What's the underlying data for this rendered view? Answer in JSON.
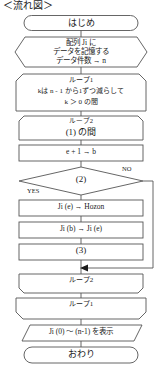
{
  "diagram": {
    "title": "＜流れ図＞",
    "type": "flowchart",
    "language": "ja",
    "colors": {
      "stroke": "#555555",
      "text": "#1a1a1a",
      "background": "#ffffff"
    }
  },
  "nodes": {
    "start": {
      "shape": "terminator",
      "text": "はじめ"
    },
    "prepare": {
      "shape": "hexagon",
      "line1": "配列 Ji に",
      "line2": "データを記憶する",
      "line3": "データ件数 → n"
    },
    "loop1_start": {
      "shape": "loop-start",
      "line1": "ループ1",
      "line2": "kは n - 1 から1ずつ減らして",
      "line3": "k ＞ 0 の間"
    },
    "loop2_start": {
      "shape": "loop-start",
      "line1": "ループ2",
      "line2": "(1) の間"
    },
    "process_b": {
      "shape": "process",
      "text": "e + 1 → b"
    },
    "decision": {
      "shape": "decision",
      "text": "(2)"
    },
    "proc_hozon": {
      "shape": "process",
      "text": "Ji (e)  →  Hozon"
    },
    "proc_jib": {
      "shape": "process",
      "text": "Ji (b)  →  Ji (e)"
    },
    "proc_blank3": {
      "shape": "process",
      "text": "(3)"
    },
    "loop2_end": {
      "shape": "loop-end",
      "text": "ループ2"
    },
    "loop1_end": {
      "shape": "loop-end",
      "text": "ループ1"
    },
    "output": {
      "shape": "parallelogram",
      "text": "Ji (0) ～ (n-1) を表示"
    },
    "end": {
      "shape": "terminator",
      "text": "おわり"
    }
  },
  "branches": {
    "yes": "YES",
    "no": "NO"
  }
}
